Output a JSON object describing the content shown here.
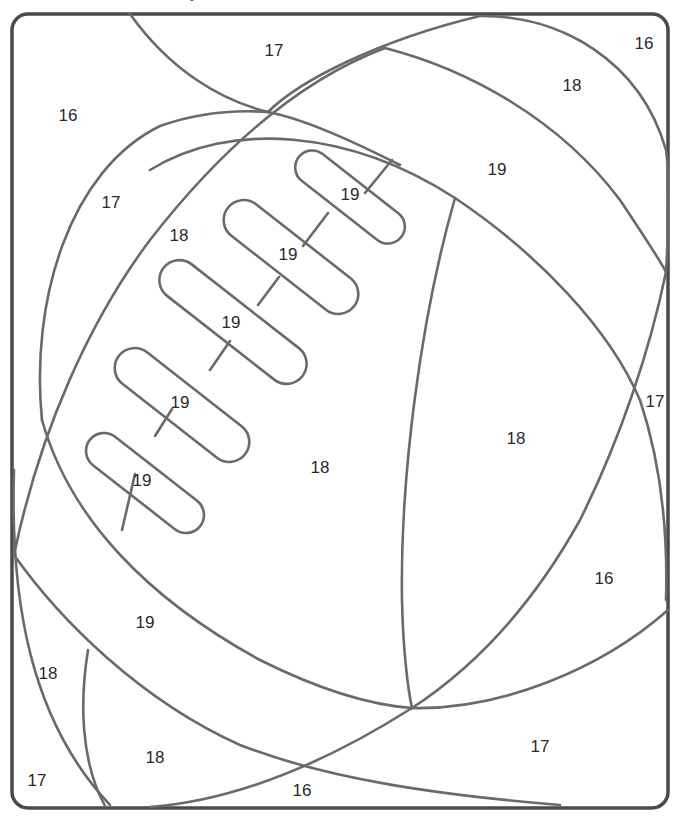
{
  "page": {
    "type": "color-by-number worksheet",
    "title_fragment": "y"
  },
  "style": {
    "frame_color": "#4a4a4a",
    "line_color": "#6a6a6a",
    "number_color": "#2a2a2a",
    "background": "#ffffff"
  },
  "regions": [
    {
      "id": "r1",
      "label": "17",
      "x": 274,
      "y": 52
    },
    {
      "id": "r2",
      "label": "16",
      "x": 644,
      "y": 45
    },
    {
      "id": "r3",
      "label": "16",
      "x": 68,
      "y": 117
    },
    {
      "id": "r4",
      "label": "18",
      "x": 572,
      "y": 87
    },
    {
      "id": "r5",
      "label": "19",
      "x": 497,
      "y": 171
    },
    {
      "id": "r6",
      "label": "17",
      "x": 111,
      "y": 204
    },
    {
      "id": "r7",
      "label": "18",
      "x": 179,
      "y": 237
    },
    {
      "id": "r8",
      "label": "19",
      "x": 350,
      "y": 196
    },
    {
      "id": "r9",
      "label": "19",
      "x": 288,
      "y": 256
    },
    {
      "id": "r10",
      "label": "19",
      "x": 231,
      "y": 324
    },
    {
      "id": "r11",
      "label": "19",
      "x": 180,
      "y": 404
    },
    {
      "id": "r12",
      "label": "19",
      "x": 142,
      "y": 482
    },
    {
      "id": "r13",
      "label": "18",
      "x": 320,
      "y": 469
    },
    {
      "id": "r14",
      "label": "18",
      "x": 516,
      "y": 440
    },
    {
      "id": "r15",
      "label": "17",
      "x": 655,
      "y": 403
    },
    {
      "id": "r16",
      "label": "16",
      "x": 604,
      "y": 580
    },
    {
      "id": "r17",
      "label": "19",
      "x": 145,
      "y": 624
    },
    {
      "id": "r18",
      "label": "18",
      "x": 48,
      "y": 675
    },
    {
      "id": "r19",
      "label": "18",
      "x": 155,
      "y": 759
    },
    {
      "id": "r20",
      "label": "17",
      "x": 540,
      "y": 748
    },
    {
      "id": "r21",
      "label": "17",
      "x": 37,
      "y": 782
    },
    {
      "id": "r22",
      "label": "16",
      "x": 302,
      "y": 792
    }
  ]
}
